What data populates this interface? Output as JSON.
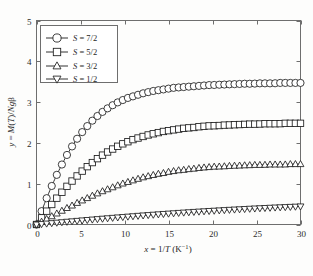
{
  "chart_data": {
    "type": "line",
    "title": "",
    "subtitle": "",
    "xlabel": "x = 1/T (K⁻¹)",
    "ylabel": "y = M(T)/Ngβ",
    "xlim": [
      0,
      30
    ],
    "ylim": [
      0,
      5
    ],
    "xticks": [
      0,
      5,
      10,
      15,
      20,
      25,
      30
    ],
    "xtick_labels": [
      "0",
      "5",
      "10",
      "15",
      "20",
      "25",
      "30"
    ],
    "yticks": [
      0,
      1,
      2,
      3,
      4,
      5
    ],
    "ytick_labels": [
      "0",
      "1",
      "2",
      "3",
      "4",
      "5"
    ],
    "grid": false,
    "legend_position": "upper-left",
    "marker_fill": "#ffffff",
    "line_color": "#1c1c1c",
    "axis_color": "#6e6e6e",
    "series": [
      {
        "name": "S = 7/2",
        "marker": "circle",
        "saturation": 3.5,
        "x": [
          0.0,
          0.6,
          1.2,
          1.8,
          2.4,
          3.0,
          3.6,
          4.2,
          4.8,
          5.4,
          6.0,
          6.6,
          7.2,
          7.8,
          8.4,
          9.0,
          9.6,
          10.2,
          10.8,
          11.4,
          12.0,
          12.6,
          13.2,
          13.8,
          14.4,
          15.0,
          15.6,
          16.2,
          16.8,
          17.4,
          18.0,
          18.6,
          19.2,
          19.8,
          20.4,
          21.0,
          21.6,
          22.2,
          22.8,
          23.4,
          24.0,
          24.6,
          25.2,
          25.8,
          26.4,
          27.0,
          27.6,
          28.2,
          28.8,
          29.4,
          30.0
        ],
        "y": [
          0.0,
          0.34,
          0.67,
          0.98,
          1.26,
          1.52,
          1.76,
          1.97,
          2.16,
          2.32,
          2.47,
          2.6,
          2.71,
          2.81,
          2.89,
          2.97,
          3.03,
          3.09,
          3.13,
          3.17,
          3.21,
          3.24,
          3.27,
          3.29,
          3.31,
          3.33,
          3.35,
          3.36,
          3.37,
          3.38,
          3.39,
          3.4,
          3.41,
          3.42,
          3.42,
          3.43,
          3.43,
          3.44,
          3.44,
          3.45,
          3.45,
          3.45,
          3.46,
          3.46,
          3.46,
          3.46,
          3.47,
          3.47,
          3.47,
          3.47,
          3.47
        ]
      },
      {
        "name": "S = 5/2",
        "marker": "square",
        "saturation": 2.5,
        "x": [
          0.0,
          0.6,
          1.2,
          1.8,
          2.4,
          3.0,
          3.6,
          4.2,
          4.8,
          5.4,
          6.0,
          6.6,
          7.2,
          7.8,
          8.4,
          9.0,
          9.6,
          10.2,
          10.8,
          11.4,
          12.0,
          12.6,
          13.2,
          13.8,
          14.4,
          15.0,
          15.6,
          16.2,
          16.8,
          17.4,
          18.0,
          18.6,
          19.2,
          19.8,
          20.4,
          21.0,
          21.6,
          22.2,
          22.8,
          23.4,
          24.0,
          24.6,
          25.2,
          25.8,
          26.4,
          27.0,
          27.6,
          28.2,
          28.8,
          29.4,
          30.0
        ],
        "y": [
          0.0,
          0.17,
          0.34,
          0.51,
          0.67,
          0.82,
          0.97,
          1.1,
          1.23,
          1.35,
          1.46,
          1.56,
          1.66,
          1.74,
          1.82,
          1.89,
          1.96,
          2.01,
          2.07,
          2.11,
          2.15,
          2.19,
          2.22,
          2.25,
          2.28,
          2.3,
          2.32,
          2.34,
          2.36,
          2.37,
          2.38,
          2.4,
          2.41,
          2.42,
          2.42,
          2.43,
          2.44,
          2.44,
          2.45,
          2.45,
          2.46,
          2.46,
          2.46,
          2.47,
          2.47,
          2.47,
          2.47,
          2.48,
          2.48,
          2.48,
          2.48
        ]
      },
      {
        "name": "S = 3/2",
        "marker": "triangle-up",
        "saturation": 1.5,
        "x": [
          0.0,
          0.6,
          1.2,
          1.8,
          2.4,
          3.0,
          3.6,
          4.2,
          4.8,
          5.4,
          6.0,
          6.6,
          7.2,
          7.8,
          8.4,
          9.0,
          9.6,
          10.2,
          10.8,
          11.4,
          12.0,
          12.6,
          13.2,
          13.8,
          14.4,
          15.0,
          15.6,
          16.2,
          16.8,
          17.4,
          18.0,
          18.6,
          19.2,
          19.8,
          20.4,
          21.0,
          21.6,
          22.2,
          22.8,
          23.4,
          24.0,
          24.6,
          25.2,
          25.8,
          26.4,
          27.0,
          27.6,
          28.2,
          28.8,
          29.4,
          30.0
        ],
        "y": [
          0.0,
          0.07,
          0.14,
          0.21,
          0.28,
          0.35,
          0.42,
          0.48,
          0.55,
          0.61,
          0.67,
          0.73,
          0.79,
          0.84,
          0.89,
          0.94,
          0.99,
          1.03,
          1.07,
          1.11,
          1.15,
          1.18,
          1.21,
          1.24,
          1.26,
          1.29,
          1.31,
          1.33,
          1.34,
          1.36,
          1.37,
          1.39,
          1.4,
          1.41,
          1.42,
          1.42,
          1.43,
          1.44,
          1.44,
          1.45,
          1.45,
          1.46,
          1.46,
          1.46,
          1.47,
          1.47,
          1.47,
          1.47,
          1.48,
          1.48,
          1.48
        ]
      },
      {
        "name": "S = 1/2",
        "marker": "triangle-down",
        "saturation": 0.5,
        "x": [
          0.0,
          0.6,
          1.2,
          1.8,
          2.4,
          3.0,
          3.6,
          4.2,
          4.8,
          5.4,
          6.0,
          6.6,
          7.2,
          7.8,
          8.4,
          9.0,
          9.6,
          10.2,
          10.8,
          11.4,
          12.0,
          12.6,
          13.2,
          13.8,
          14.4,
          15.0,
          15.6,
          16.2,
          16.8,
          17.4,
          18.0,
          18.6,
          19.2,
          19.8,
          20.4,
          21.0,
          21.6,
          22.2,
          22.8,
          23.4,
          24.0,
          24.6,
          25.2,
          25.8,
          26.4,
          27.0,
          27.6,
          28.2,
          28.8,
          29.4,
          30.0
        ],
        "y": [
          0.0,
          0.012,
          0.024,
          0.035,
          0.047,
          0.058,
          0.07,
          0.081,
          0.093,
          0.104,
          0.115,
          0.126,
          0.137,
          0.148,
          0.159,
          0.169,
          0.18,
          0.19,
          0.2,
          0.21,
          0.22,
          0.23,
          0.239,
          0.249,
          0.258,
          0.267,
          0.276,
          0.285,
          0.293,
          0.302,
          0.31,
          0.318,
          0.326,
          0.334,
          0.341,
          0.349,
          0.356,
          0.363,
          0.37,
          0.377,
          0.384,
          0.39,
          0.397,
          0.403,
          0.409,
          0.415,
          0.421,
          0.426,
          0.432,
          0.437,
          0.443
        ]
      }
    ]
  },
  "legend": {
    "items": [
      {
        "label": "S = 7/2",
        "symbol": "S",
        "equals": " = ",
        "value": "7/2"
      },
      {
        "label": "S = 5/2",
        "symbol": "S",
        "equals": " = ",
        "value": "5/2"
      },
      {
        "label": "S = 3/2",
        "symbol": "S",
        "equals": " = ",
        "value": "3/2"
      },
      {
        "label": "S = 1/2",
        "symbol": "S",
        "equals": " = ",
        "value": "1/2"
      }
    ]
  },
  "axes": {
    "x_title_parts": {
      "var": "x",
      "eq": " = 1/",
      "temp": "T",
      "unit": " (K",
      "exp": "−1",
      "close": ")"
    },
    "y_title_parts": {
      "var": "y",
      "eq": " = ",
      "mag": "M",
      "open": "(",
      "temp": "T",
      "close": ")/",
      "denom": "Ng",
      "beta": "β"
    }
  }
}
